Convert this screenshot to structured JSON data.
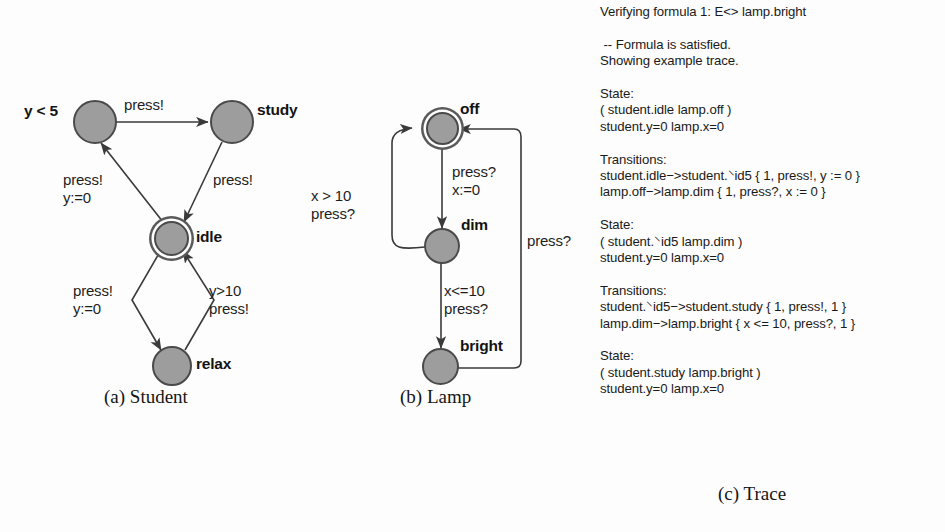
{
  "figure": {
    "student": {
      "caption": "(a) Student",
      "nodes": [
        {
          "id": "study_src",
          "label": "y < 5",
          "label_side": "left",
          "initial": false
        },
        {
          "id": "study",
          "label": "study",
          "label_side": "right",
          "initial": false
        },
        {
          "id": "idle",
          "label": "idle",
          "label_side": "right",
          "initial": true
        },
        {
          "id": "relax",
          "label": "relax",
          "label_side": "right",
          "initial": false
        }
      ],
      "edge_labels": [
        {
          "id": "top",
          "text": "press!"
        },
        {
          "id": "left-upper",
          "text": "press!\ny:=0"
        },
        {
          "id": "right-upper",
          "text": "press!"
        },
        {
          "id": "left-lower",
          "text": "press!\ny:=0"
        },
        {
          "id": "right-lower",
          "text": "y>10\npress!"
        }
      ]
    },
    "lamp": {
      "caption": "(b) Lamp",
      "nodes": [
        {
          "id": "off",
          "label": "off",
          "label_side": "right",
          "initial": true
        },
        {
          "id": "dim",
          "label": "dim",
          "label_side": "right",
          "initial": false
        },
        {
          "id": "bright",
          "label": "bright",
          "label_side": "right",
          "initial": false
        }
      ],
      "edge_labels": [
        {
          "id": "off-to-dim",
          "text": "press?\nx:=0"
        },
        {
          "id": "dim-to-off",
          "text": "x > 10\npress?"
        },
        {
          "id": "dim-to-bright",
          "text": "x<=10\npress?"
        },
        {
          "id": "bright-to-off",
          "text": "press?"
        }
      ]
    },
    "trace": {
      "caption": "(c) Trace",
      "lines": [
        "Verifying formula 1: E<> lamp.bright",
        "",
        " -- Formula is satisfied.",
        "Showing example trace.",
        "",
        "State:",
        "( student.idle lamp.off )",
        "student.y=0 lamp.x=0",
        "",
        "Transitions:",
        "student.idle−>student.⸌id5 { 1, press!, y := 0 }",
        "lamp.off−>lamp.dim { 1, press?, x := 0 }",
        "",
        "State:",
        "( student.⸌id5 lamp.dim )",
        "student.y=0 lamp.x=0",
        "",
        "Transitions:",
        "student.⸌id5−>student.study { 1, press!, 1 }",
        "lamp.dim−>lamp.bright { x <= 10, press?, 1 }",
        "",
        "State:",
        "( student.study lamp.bright )",
        "student.y=0 lamp.x=0"
      ]
    }
  },
  "colors": {
    "node_fill": "#9d9d9d",
    "node_stroke": "#4a4a4a",
    "edge_stroke": "#3a3a3a",
    "text": "#1a1a1a",
    "background": "#fdfdfd"
  }
}
